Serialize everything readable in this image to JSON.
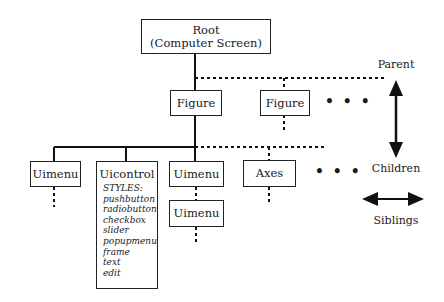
{
  "nodes": {
    "root": {
      "line1": "Root",
      "line2": "(Computer Screen)"
    },
    "figure1": {
      "label": "Figure"
    },
    "figure2": {
      "label": "Figure"
    },
    "uimenu1": {
      "label": "Uimenu"
    },
    "uicontrol": {
      "label": "Uicontrol",
      "styles_header": "STYLES:",
      "styles": [
        "pushbutton",
        "radiobutton",
        "checkbox",
        "slider",
        "popupmenu",
        "frame",
        "text",
        "edit"
      ]
    },
    "uimenu2": {
      "label": "Uimenu"
    },
    "uimenu3": {
      "label": "Uimenu"
    },
    "axes": {
      "label": "Axes"
    }
  },
  "ellipsis": {
    "figures": "• • •",
    "children": "• • •"
  },
  "legend": {
    "parent": "Parent",
    "children": "Children",
    "siblings": "Siblings"
  }
}
